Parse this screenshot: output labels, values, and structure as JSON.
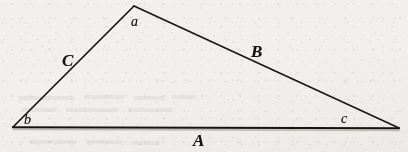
{
  "figure": {
    "kind": "geometry-diagram",
    "shape": "triangle",
    "canvas": {
      "width": 408,
      "height": 152
    },
    "colors": {
      "paper": "#f1f0ee",
      "ink": "#16130f",
      "line": "#1a1714"
    }
  },
  "geometry": {
    "vertices": [
      {
        "id": "a",
        "label": "a",
        "x": 134,
        "y": 6,
        "role": "apex"
      },
      {
        "id": "b",
        "label": "b",
        "x": 13,
        "y": 127,
        "role": "bottom-left"
      },
      {
        "id": "c",
        "label": "c",
        "x": 399,
        "y": 128,
        "role": "bottom-right"
      }
    ],
    "edges": [
      {
        "id": "A",
        "label": "A",
        "from": "b",
        "to": "c",
        "role": "base",
        "stroke_width": 2.1
      },
      {
        "id": "B",
        "label": "B",
        "from": "a",
        "to": "c",
        "role": "right-side",
        "stroke_width": 1.6
      },
      {
        "id": "C",
        "label": "C",
        "from": "b",
        "to": "a",
        "role": "left-side",
        "stroke_width": 1.6
      }
    ]
  },
  "labels": {
    "sides": [
      {
        "name": "side-label-C",
        "text": "C",
        "x": 62,
        "y": 52
      },
      {
        "name": "side-label-B",
        "text": "B",
        "x": 251,
        "y": 43
      },
      {
        "name": "side-label-A",
        "text": "A",
        "x": 193,
        "y": 132
      }
    ],
    "vertices": [
      {
        "name": "vertex-label-a",
        "text": "a",
        "x": 131,
        "y": 15
      },
      {
        "name": "vertex-label-b",
        "text": "b",
        "x": 24,
        "y": 113
      },
      {
        "name": "vertex-label-c",
        "text": "c",
        "x": 341,
        "y": 112
      }
    ]
  }
}
